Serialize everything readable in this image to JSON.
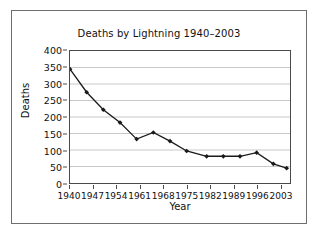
{
  "chart_data": {
    "type": "line",
    "title": "Deaths by Lightning 1940–2003",
    "xlabel": "Year",
    "ylabel": "Deaths",
    "xlim": [
      1940,
      2006
    ],
    "ylim": [
      0,
      400
    ],
    "grid": "horizontal",
    "legend": "none",
    "marker": "diamond",
    "line_color": "#1a1a1a",
    "marker_color": "#1a1a1a",
    "grid_color": "#c8c8c8",
    "axis_color": "#4a4a4a",
    "x_ticks": [
      1940,
      1947,
      1954,
      1961,
      1968,
      1975,
      1982,
      1989,
      1996,
      2003
    ],
    "y_ticks": [
      0,
      50,
      100,
      150,
      200,
      250,
      300,
      350,
      400
    ],
    "x": [
      1940,
      1945,
      1950,
      1955,
      1960,
      1965,
      1970,
      1975,
      1981,
      1986,
      1991,
      1996,
      2001,
      2005
    ],
    "values": [
      345,
      275,
      222,
      183,
      133,
      153,
      127,
      97,
      81,
      81,
      81,
      92,
      58,
      45
    ]
  }
}
